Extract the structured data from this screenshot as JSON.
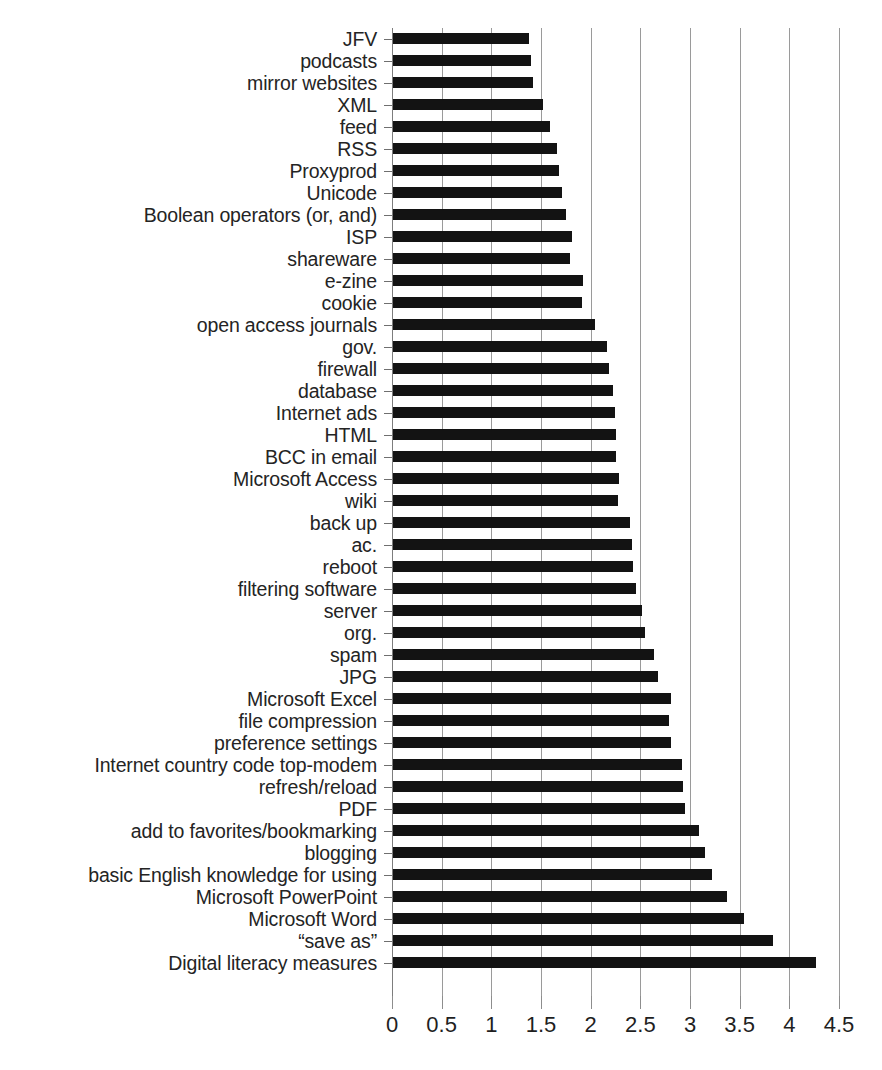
{
  "chart_data": {
    "type": "bar",
    "orientation": "horizontal",
    "title": "",
    "subtitle": "",
    "xlabel": "",
    "ylabel": "",
    "xlim": [
      0,
      4.5
    ],
    "xticks": [
      0,
      0.5,
      1,
      1.5,
      2,
      2.5,
      3,
      3.5,
      4,
      4.5
    ],
    "xtick_labels": [
      "0",
      "0.5",
      "1",
      "1.5",
      "2",
      "2.5",
      "3",
      "3.5",
      "4",
      "4.5"
    ],
    "grid": true,
    "grid_axis": "x",
    "legend": false,
    "legend_position": "none",
    "bar_color": "#131313",
    "grid_color": "#9a9a9a",
    "note": "Categories are listed top-to-bottom as drawn in the figure; values increase toward the bottom.",
    "categories": [
      "JFV",
      "podcasts",
      "mirror websites",
      "XML",
      "feed",
      "RSS",
      "Proxyprod",
      "Unicode",
      "Boolean operators (or, and)",
      "ISP",
      "shareware",
      "e-zine",
      "cookie",
      "open access journals",
      "gov.",
      "firewall",
      "database",
      "Internet ads",
      "HTML",
      "BCC in email",
      "Microsoft Access",
      "wiki",
      "back up",
      "ac.",
      "reboot",
      "filtering software",
      "server",
      "org.",
      "spam",
      "JPG",
      "Microsoft Excel",
      "file compression",
      "preference settings",
      "Internet country code top-modem",
      "refresh/reload",
      "PDF",
      "add to favorites/bookmarking",
      "blogging",
      "basic English knowledge for using",
      "Microsoft PowerPoint",
      "Microsoft Word",
      "“save as”",
      "Digital literacy measures"
    ],
    "values": [
      1.38,
      1.4,
      1.42,
      1.52,
      1.59,
      1.66,
      1.68,
      1.71,
      1.75,
      1.81,
      1.79,
      1.92,
      1.91,
      2.04,
      2.16,
      2.18,
      2.22,
      2.24,
      2.26,
      2.25,
      2.29,
      2.28,
      2.4,
      2.42,
      2.43,
      2.46,
      2.52,
      2.55,
      2.64,
      2.68,
      2.81,
      2.79,
      2.81,
      2.92,
      2.93,
      2.95,
      3.09,
      3.15,
      3.22,
      3.37,
      3.54,
      3.84,
      4.27
    ]
  }
}
